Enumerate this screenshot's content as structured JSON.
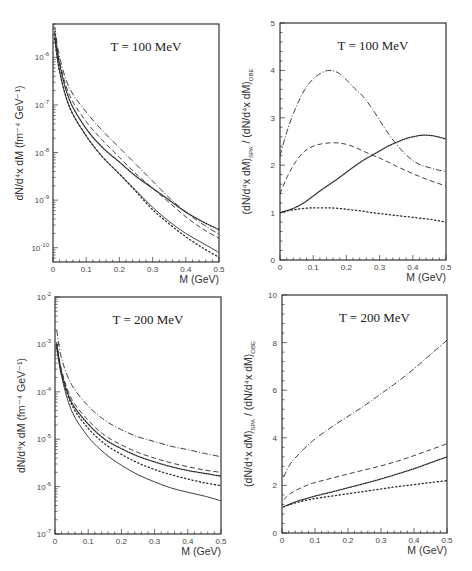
{
  "chart_data": [
    {
      "id": "tl",
      "type": "line",
      "title": "T = 100 MeV",
      "xlabel": "M (GeV)",
      "ylabel": "dN/d⁴x dM   (fm⁻⁴ GeV⁻¹)",
      "yscale": "log",
      "xlim": [
        0,
        0.5
      ],
      "ylim_log10": [
        -10.3,
        -5.3
      ],
      "xticks": [
        "0",
        "0.1",
        "0.2",
        "0.3",
        "0.4",
        "0.5"
      ],
      "yticks": [
        {
          "base": "10",
          "exp": "-6",
          "log": -6
        },
        {
          "base": "10",
          "exp": "-7",
          "log": -7
        },
        {
          "base": "10",
          "exp": "-8",
          "log": -8
        },
        {
          "base": "10",
          "exp": "-9",
          "log": -9
        },
        {
          "base": "10",
          "exp": "-10",
          "log": -10
        }
      ],
      "x": [
        0.005,
        0.02,
        0.05,
        0.1,
        0.15,
        0.2,
        0.25,
        0.3,
        0.35,
        0.4,
        0.45,
        0.5
      ],
      "series": [
        {
          "name": "dash-dot",
          "style": "dashdot",
          "log10": [
            -5.35,
            -6.0,
            -6.65,
            -7.15,
            -7.55,
            -7.9,
            -8.25,
            -8.6,
            -8.95,
            -9.25,
            -9.5,
            -9.72
          ]
        },
        {
          "name": "dashed",
          "style": "dashed",
          "log10": [
            -5.45,
            -6.1,
            -6.8,
            -7.35,
            -7.75,
            -8.1,
            -8.45,
            -8.75,
            -9.05,
            -9.35,
            -9.6,
            -9.8
          ]
        },
        {
          "name": "dense-dotted",
          "style": "densedot",
          "log10": [
            -5.5,
            -6.15,
            -6.9,
            -7.5,
            -7.9,
            -8.2,
            -8.5,
            -8.75,
            -9.0,
            -9.25,
            -9.45,
            -9.62
          ]
        },
        {
          "name": "solid",
          "style": "solid",
          "log10": [
            -5.6,
            -6.3,
            -7.05,
            -7.65,
            -8.1,
            -8.45,
            -8.8,
            -9.15,
            -9.45,
            -9.7,
            -9.9,
            -10.1
          ]
        },
        {
          "name": "sparse-dotted",
          "style": "dotted",
          "log10": [
            -5.6,
            -6.3,
            -7.05,
            -7.65,
            -8.1,
            -8.45,
            -8.82,
            -9.2,
            -9.5,
            -9.77,
            -10.0,
            -10.2
          ]
        }
      ]
    },
    {
      "id": "tr",
      "type": "line",
      "title": "T = 100 MeV",
      "xlabel": "M (GeV)",
      "ylabel_parts": {
        "num": "(dN/d⁴x dM)",
        "num_sub": "SPA",
        "sep": "/",
        "den": "(dN/d⁴x dM)",
        "den_sub": "OBE"
      },
      "yscale": "linear",
      "xlim": [
        0,
        0.5
      ],
      "ylim": [
        0,
        5
      ],
      "xticks": [
        "0",
        "0.1",
        "0.2",
        "0.3",
        "0.4",
        "0.5"
      ],
      "yticks": [
        "0",
        "1",
        "2",
        "3",
        "4",
        "5"
      ],
      "x": [
        0,
        0.025,
        0.05,
        0.075,
        0.1,
        0.125,
        0.15,
        0.175,
        0.2,
        0.225,
        0.25,
        0.275,
        0.3,
        0.325,
        0.35,
        0.375,
        0.4,
        0.425,
        0.45,
        0.475,
        0.5
      ],
      "series": [
        {
          "name": "dash-dot",
          "style": "dashdot",
          "values": [
            2.2,
            2.8,
            3.25,
            3.6,
            3.82,
            3.95,
            4.0,
            3.95,
            3.8,
            3.62,
            3.45,
            3.22,
            2.95,
            2.68,
            2.45,
            2.25,
            2.1,
            2.0,
            1.95,
            1.9,
            1.87
          ]
        },
        {
          "name": "dashed",
          "style": "dashed",
          "values": [
            1.4,
            1.8,
            2.1,
            2.3,
            2.4,
            2.45,
            2.47,
            2.47,
            2.44,
            2.38,
            2.3,
            2.22,
            2.15,
            2.07,
            1.98,
            1.9,
            1.82,
            1.75,
            1.68,
            1.62,
            1.56
          ]
        },
        {
          "name": "dense-dotted",
          "style": "densedot",
          "values": [
            1.0,
            1.05,
            1.12,
            1.22,
            1.35,
            1.48,
            1.6,
            1.72,
            1.85,
            1.98,
            2.1,
            2.2,
            2.3,
            2.4,
            2.48,
            2.55,
            2.6,
            2.63,
            2.63,
            2.6,
            2.55
          ]
        },
        {
          "name": "sparse-dotted",
          "style": "dotted",
          "values": [
            1.0,
            1.04,
            1.07,
            1.09,
            1.1,
            1.1,
            1.1,
            1.09,
            1.07,
            1.05,
            1.03,
            1.0,
            0.98,
            0.96,
            0.94,
            0.92,
            0.9,
            0.88,
            0.86,
            0.83,
            0.8
          ]
        }
      ]
    },
    {
      "id": "bl",
      "type": "line",
      "title": "T = 200 MeV",
      "xlabel": "M (GeV)",
      "ylabel": "dN/d⁴x dM   (fm⁻⁴ GeV⁻¹)",
      "yscale": "log",
      "xlim": [
        0,
        0.5
      ],
      "ylim_log10": [
        -7,
        -2
      ],
      "xticks": [
        "0",
        "0.1",
        "0.2",
        "0.3",
        "0.4",
        "0.5"
      ],
      "yticks": [
        {
          "base": "10",
          "exp": "-2",
          "log": -2
        },
        {
          "base": "10",
          "exp": "-3",
          "log": -3
        },
        {
          "base": "10",
          "exp": "-4",
          "log": -4
        },
        {
          "base": "10",
          "exp": "-5",
          "log": -5
        },
        {
          "base": "10",
          "exp": "-6",
          "log": -6
        },
        {
          "base": "10",
          "exp": "-7",
          "log": -7
        }
      ],
      "x": [
        0.005,
        0.02,
        0.05,
        0.1,
        0.15,
        0.2,
        0.25,
        0.3,
        0.35,
        0.4,
        0.45,
        0.5
      ],
      "series": [
        {
          "name": "dash-dot",
          "style": "dashdot",
          "log10": [
            -2.7,
            -3.3,
            -3.85,
            -4.3,
            -4.6,
            -4.8,
            -4.95,
            -5.05,
            -5.15,
            -5.22,
            -5.3,
            -5.37
          ]
        },
        {
          "name": "dashed",
          "style": "dashed",
          "log10": [
            -2.95,
            -3.55,
            -4.15,
            -4.6,
            -4.92,
            -5.12,
            -5.28,
            -5.4,
            -5.5,
            -5.58,
            -5.65,
            -5.7
          ]
        },
        {
          "name": "dense-dotted",
          "style": "densedot",
          "log10": [
            -3.0,
            -3.6,
            -4.22,
            -4.68,
            -5.0,
            -5.2,
            -5.36,
            -5.48,
            -5.58,
            -5.66,
            -5.72,
            -5.78
          ]
        },
        {
          "name": "sparse-dotted",
          "style": "dotted",
          "log10": [
            -3.0,
            -3.62,
            -4.27,
            -4.77,
            -5.1,
            -5.32,
            -5.5,
            -5.64,
            -5.75,
            -5.84,
            -5.92,
            -5.98
          ]
        },
        {
          "name": "solid",
          "style": "solid",
          "log10": [
            -3.05,
            -3.68,
            -4.4,
            -4.95,
            -5.3,
            -5.55,
            -5.75,
            -5.9,
            -6.03,
            -6.12,
            -6.2,
            -6.3
          ]
        }
      ]
    },
    {
      "id": "br",
      "type": "line",
      "title": "T = 200 MeV",
      "xlabel": "M (GeV)",
      "ylabel_parts": {
        "num": "(dN/d⁴x dM)",
        "num_sub": "SPA",
        "sep": "/",
        "den": "(dN/d⁴x dM)",
        "den_sub": "OBE"
      },
      "yscale": "linear",
      "xlim": [
        0,
        0.5
      ],
      "ylim": [
        0,
        10
      ],
      "xticks": [
        "0",
        "0.1",
        "0.2",
        "0.3",
        "0.4",
        "0.5"
      ],
      "yticks": [
        "0",
        "2",
        "4",
        "6",
        "8",
        "10"
      ],
      "x": [
        0.005,
        0.025,
        0.05,
        0.075,
        0.1,
        0.15,
        0.2,
        0.25,
        0.3,
        0.35,
        0.4,
        0.45,
        0.5
      ],
      "series": [
        {
          "name": "dash-dot",
          "style": "dashdot",
          "values": [
            2.35,
            2.9,
            3.3,
            3.65,
            3.95,
            4.45,
            4.9,
            5.35,
            5.85,
            6.35,
            6.9,
            7.5,
            8.1
          ]
        },
        {
          "name": "dashed",
          "style": "dashed",
          "values": [
            1.4,
            1.65,
            1.85,
            2.0,
            2.12,
            2.3,
            2.48,
            2.65,
            2.82,
            3.02,
            3.25,
            3.5,
            3.75
          ]
        },
        {
          "name": "dense-dotted",
          "style": "densedot",
          "values": [
            1.1,
            1.22,
            1.35,
            1.45,
            1.55,
            1.72,
            1.9,
            2.08,
            2.27,
            2.48,
            2.7,
            2.95,
            3.2
          ]
        },
        {
          "name": "sparse-dotted",
          "style": "dotted",
          "values": [
            1.1,
            1.2,
            1.3,
            1.38,
            1.45,
            1.55,
            1.65,
            1.75,
            1.85,
            1.95,
            2.03,
            2.12,
            2.2
          ]
        }
      ]
    }
  ],
  "panels": {
    "tl": {
      "title": "T = 100 MeV",
      "xlabel": "M (GeV)",
      "ylabel_main": "dN/d",
      "ylabel_sup": "4",
      "ylabel_rest": "x dM   (fm",
      "ylabel_sup2": "-4",
      "ylabel_tail": " GeV",
      "ylabel_sup3": "-1",
      "ylabel_close": ")"
    },
    "tr": {
      "title": "T = 100 MeV",
      "xlabel": "M (GeV)"
    },
    "bl": {
      "title": "T = 200 MeV",
      "xlabel": "M (GeV)"
    },
    "br": {
      "title": "T = 200 MeV",
      "xlabel": "M (GeV)"
    }
  }
}
